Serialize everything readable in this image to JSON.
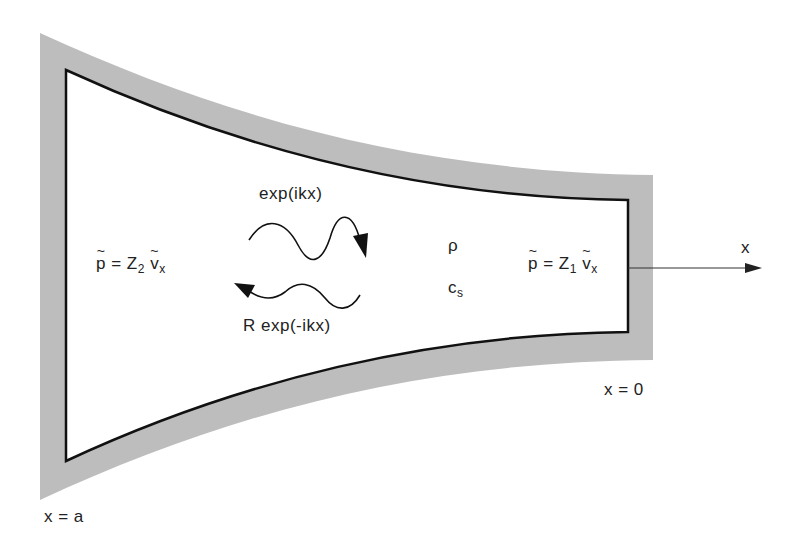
{
  "diagram": {
    "colors": {
      "wall": "#bdbdbd",
      "outline": "#111111",
      "text": "#222222",
      "background": "#ffffff"
    },
    "labels": {
      "left_bc": {
        "lhs": "p",
        "eq": " = Z",
        "sub": "2",
        "rhs": "v",
        "rhs_sub": "x"
      },
      "right_bc": {
        "lhs": "p",
        "eq": " = Z",
        "sub": "1",
        "rhs": "v",
        "rhs_sub": "x"
      },
      "incident_wave": "exp(ikx)",
      "reflected_wave": "R exp(-ikx)",
      "density": "ρ",
      "sound_speed": {
        "base": "c",
        "sub": "s"
      },
      "axis": "x",
      "x_right": "x = 0",
      "x_left": "x = a"
    }
  }
}
